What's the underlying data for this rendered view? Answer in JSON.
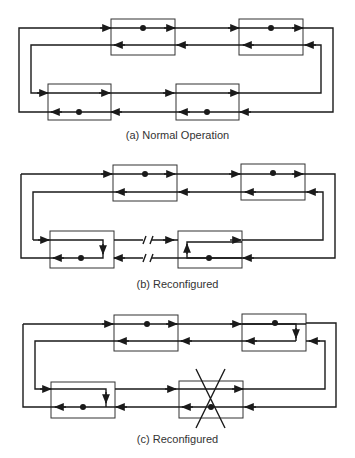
{
  "diagrams": [
    {
      "id": "a",
      "caption": "(a) Normal Operation",
      "state": "normal",
      "failed_link": false,
      "failed_node": false
    },
    {
      "id": "b",
      "caption": "(b) Reconfigured",
      "state": "link-failure",
      "failed_link": true,
      "failed_node": false
    },
    {
      "id": "c",
      "caption": "(c) Reconfigured",
      "state": "node-failure",
      "failed_link": false,
      "failed_node": true
    }
  ],
  "colors": {
    "line": "#1a1a1a",
    "box": "#333333",
    "background": "#ffffff"
  }
}
